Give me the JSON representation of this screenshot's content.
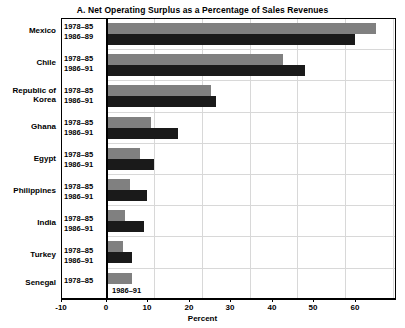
{
  "chart_data": {
    "type": "bar",
    "orientation": "horizontal",
    "title": "A. Net Operating Surplus as a Percentage of Sales Revenues",
    "xlabel": "Percent",
    "ylabel": "",
    "xlim": [
      -10,
      60
    ],
    "xticks": [
      -10,
      0,
      10,
      20,
      30,
      40,
      50,
      60
    ],
    "xticklabels": [
      "-10",
      "0",
      "10",
      "20",
      "30",
      "40",
      "50",
      "60"
    ],
    "grid": "vertical",
    "legend": "none",
    "categories": [
      "Mexico",
      "Chile",
      "Republic of Korea",
      "Ghana",
      "Egypt",
      "Philippines",
      "India",
      "Turkey",
      "Senegal"
    ],
    "series": [
      {
        "name": "1978–85",
        "color": "#808080",
        "values": [
          56.5,
          37.0,
          22.0,
          9.5,
          7.0,
          5.0,
          4.0,
          3.5,
          5.5
        ]
      },
      {
        "name": "1986–91",
        "color": "#1a1a1a",
        "values": [
          52.0,
          41.5,
          23.0,
          15.0,
          10.0,
          8.5,
          8.0,
          5.5,
          -2.0
        ]
      }
    ],
    "rows": [
      {
        "country": "Mexico",
        "country_lines": [
          "Mexico"
        ],
        "periods": [
          "1978–85",
          "1986–89"
        ],
        "values": [
          56.5,
          52.0
        ],
        "period_inside_plot": [
          false,
          false
        ]
      },
      {
        "country": "Chile",
        "country_lines": [
          "Chile"
        ],
        "periods": [
          "1978–85",
          "1986–91"
        ],
        "values": [
          37.0,
          41.5
        ],
        "period_inside_plot": [
          false,
          false
        ]
      },
      {
        "country": "Republic of Korea",
        "country_lines": [
          "Republic of",
          "Korea"
        ],
        "periods": [
          "1978–85",
          "1986–91"
        ],
        "values": [
          22.0,
          23.0
        ],
        "period_inside_plot": [
          false,
          false
        ]
      },
      {
        "country": "Ghana",
        "country_lines": [
          "Ghana"
        ],
        "periods": [
          "1978–85",
          "1986–91"
        ],
        "values": [
          9.5,
          15.0
        ],
        "period_inside_plot": [
          false,
          false
        ]
      },
      {
        "country": "Egypt",
        "country_lines": [
          "Egypt"
        ],
        "periods": [
          "1978–85",
          "1986–91"
        ],
        "values": [
          7.0,
          10.0
        ],
        "period_inside_plot": [
          false,
          false
        ]
      },
      {
        "country": "Philippines",
        "country_lines": [
          "Philippines"
        ],
        "periods": [
          "1978–85",
          "1986–91"
        ],
        "values": [
          5.0,
          8.5
        ],
        "period_inside_plot": [
          false,
          false
        ]
      },
      {
        "country": "India",
        "country_lines": [
          "India"
        ],
        "periods": [
          "1978–85",
          "1986–91"
        ],
        "values": [
          4.0,
          8.0
        ],
        "period_inside_plot": [
          false,
          false
        ]
      },
      {
        "country": "Turkey",
        "country_lines": [
          "Turkey"
        ],
        "periods": [
          "1978–85",
          "1986–91"
        ],
        "values": [
          3.5,
          5.5
        ],
        "period_inside_plot": [
          false,
          false
        ]
      },
      {
        "country": "Senegal",
        "country_lines": [
          "Senegal"
        ],
        "periods": [
          "1978–85",
          "1986–91"
        ],
        "values": [
          5.5,
          -2.0
        ],
        "period_inside_plot": [
          false,
          true
        ]
      }
    ]
  },
  "labels": {
    "mexico": "Mexico",
    "chile": "Chile",
    "korea_line1": "Republic of",
    "korea_line2": "Korea",
    "ghana": "Ghana",
    "egypt": "Egypt",
    "philippines": "Philippines",
    "india": "India",
    "turkey": "Turkey",
    "senegal": "Senegal",
    "p1978_85": "1978–85",
    "p1986_89": "1986–89",
    "p1986_91": "1986–91"
  },
  "axis": {
    "title": "Percent",
    "tick_m10": "-10",
    "tick_0": "0",
    "tick_10": "10",
    "tick_20": "20",
    "tick_30": "30",
    "tick_40": "40",
    "tick_50": "50",
    "tick_60": "60"
  },
  "title": {
    "text": "A. Net Operating Surplus as a Percentage of Sales Revenues"
  },
  "colors": {
    "series1": "#808080",
    "series2": "#1a1a1a",
    "grid": "#d8d8d8",
    "frame": "#000000",
    "background": "#ffffff"
  }
}
